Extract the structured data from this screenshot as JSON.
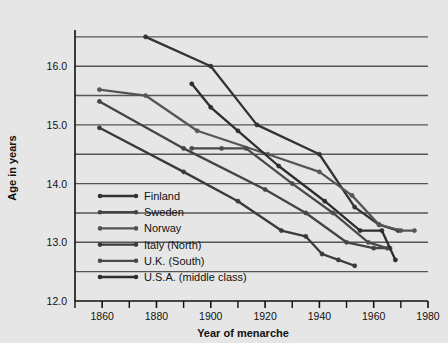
{
  "chart_data": {
    "type": "line",
    "title": "",
    "xlabel": "Year of menarche",
    "ylabel": "Age in years",
    "xlim": [
      1850,
      1980
    ],
    "ylim": [
      12.0,
      16.6
    ],
    "grid": true,
    "grid_axis": "y",
    "grid_values": [
      12.5,
      13.0,
      13.5,
      14.0,
      14.5,
      15.0,
      15.5,
      16.0,
      16.5
    ],
    "x_ticks_major": [
      1860,
      1880,
      1900,
      1920,
      1940,
      1960,
      1980
    ],
    "x_tick_labels": [
      "1860",
      "1880",
      "1900",
      "1920",
      "1940",
      "1960",
      "1980"
    ],
    "x_ticks_minor": [
      1850,
      1870,
      1890,
      1910,
      1930,
      1950,
      1970
    ],
    "y_ticks": [
      12.0,
      13.0,
      14.0,
      15.0,
      16.0
    ],
    "y_tick_labels": [
      "12.0",
      "13.0",
      "14.0",
      "15.0",
      "16.0"
    ],
    "legend_position": "inside-lower-left",
    "series": [
      {
        "name": "Finland",
        "color": "#333333",
        "points": [
          [
            1876,
            16.5
          ],
          [
            1900,
            16.0
          ],
          [
            1917,
            15.0
          ],
          [
            1940,
            14.5
          ],
          [
            1953,
            13.6
          ],
          [
            1962,
            13.3
          ],
          [
            1969,
            13.2
          ]
        ]
      },
      {
        "name": "Sweden",
        "color": "#444444",
        "points": [
          [
            1859,
            15.4
          ],
          [
            1890,
            14.6
          ],
          [
            1920,
            13.9
          ],
          [
            1935,
            13.5
          ],
          [
            1950,
            13.0
          ],
          [
            1960,
            12.9
          ],
          [
            1966,
            12.9
          ]
        ]
      },
      {
        "name": "Norway",
        "color": "#555555",
        "points": [
          [
            1859,
            15.6
          ],
          [
            1876,
            15.5
          ],
          [
            1895,
            14.9
          ],
          [
            1921,
            14.5
          ],
          [
            1940,
            14.2
          ],
          [
            1952,
            13.8
          ],
          [
            1962,
            13.3
          ],
          [
            1970,
            13.2
          ],
          [
            1975,
            13.2
          ]
        ]
      },
      {
        "name": "Italy (North)",
        "color": "#3a3a3a",
        "points": [
          [
            1859,
            14.95
          ],
          [
            1890,
            14.2
          ],
          [
            1910,
            13.7
          ],
          [
            1926,
            13.2
          ],
          [
            1935,
            13.1
          ],
          [
            1941,
            12.8
          ],
          [
            1947,
            12.7
          ],
          [
            1953,
            12.6
          ]
        ]
      },
      {
        "name": "U.K. (South)",
        "color": "#4a4a4a",
        "points": [
          [
            1893,
            14.6
          ],
          [
            1904,
            14.6
          ],
          [
            1913,
            14.6
          ],
          [
            1930,
            14.0
          ],
          [
            1945,
            13.5
          ],
          [
            1958,
            13.0
          ],
          [
            1965,
            12.9
          ]
        ]
      },
      {
        "name": "U.S.A. (middle class)",
        "color": "#2e2e2e",
        "points": [
          [
            1893,
            15.7
          ],
          [
            1900,
            15.3
          ],
          [
            1910,
            14.9
          ],
          [
            1925,
            14.3
          ],
          [
            1942,
            13.7
          ],
          [
            1955,
            13.2
          ],
          [
            1963,
            13.2
          ],
          [
            1968,
            12.7
          ]
        ]
      }
    ]
  },
  "legend": {
    "entries": [
      {
        "label": "Finland"
      },
      {
        "label": "Sweden"
      },
      {
        "label": "Norway"
      },
      {
        "label": "Italy (North)"
      },
      {
        "label": "U.K. (South)"
      },
      {
        "label": "U.S.A. (middle class)"
      }
    ]
  },
  "colors": {
    "background": "#e6e6e6",
    "line": "#3a3a3a",
    "grid": "#555555",
    "text": "#111111"
  }
}
